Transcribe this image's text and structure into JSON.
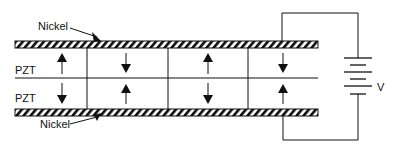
{
  "diagram": {
    "labels": {
      "nickel_top": "Nickel",
      "nickel_bottom": "Nickel",
      "pzt_top": "PZT",
      "pzt_bottom": "PZT",
      "voltage": "V"
    },
    "layers": [
      "Nickel",
      "PZT",
      "PZT",
      "Nickel"
    ],
    "segments": [
      {
        "index": 1,
        "top_polarization": "up",
        "bottom_polarization": "down"
      },
      {
        "index": 2,
        "top_polarization": "down",
        "bottom_polarization": "up"
      },
      {
        "index": 3,
        "top_polarization": "up",
        "bottom_polarization": "down"
      },
      {
        "index": 4,
        "top_polarization": "down",
        "bottom_polarization": "up"
      }
    ],
    "colors": {
      "line": "#111111",
      "background": "#ffffff"
    }
  }
}
